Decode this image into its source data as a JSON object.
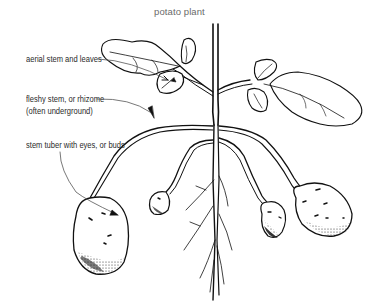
{
  "diagram": {
    "title": "potato plant",
    "labels": [
      {
        "id": "aerial",
        "text": "aerial stem and leaves"
      },
      {
        "id": "rhizome_1",
        "text": "fleshy stem, or rhizome"
      },
      {
        "id": "rhizome_2",
        "text": "(often underground)"
      },
      {
        "id": "tuber",
        "text": "stem tuber with eyes, or buds"
      }
    ],
    "colors": {
      "line": "#111111",
      "label_text": "#2a2a2a",
      "title_text": "#6a6a6a",
      "leader_line": "#555555"
    }
  }
}
